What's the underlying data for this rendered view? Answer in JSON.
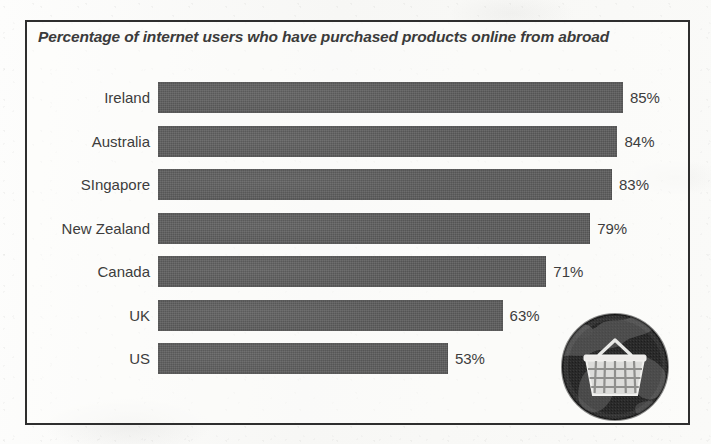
{
  "chart_data": {
    "type": "bar",
    "orientation": "horizontal",
    "title": "Percentage of internet users who have purchased products online from abroad",
    "xlabel": "",
    "ylabel": "",
    "xlim": [
      0,
      100
    ],
    "grid": false,
    "legend": "none",
    "unit": "%",
    "categories": [
      "Ireland",
      "Australia",
      "SIngapore",
      "New Zealand",
      "Canada",
      "UK",
      "US"
    ],
    "values": [
      85,
      84,
      83,
      79,
      71,
      63,
      53
    ],
    "value_labels": [
      "85%",
      "84%",
      "83%",
      "79%",
      "71%",
      "63%",
      "53%"
    ],
    "bar_color": "#5c5c5c",
    "text_color": "#3d3d3d",
    "background_color": "#fbfbfa",
    "border_color": "#2e2e2e"
  },
  "figure": {
    "title": "Percentage of internet users who have purchased products online from abroad",
    "rows": [
      {
        "label": "Ireland",
        "value": 85,
        "value_label": "85%"
      },
      {
        "label": "Australia",
        "value": 84,
        "value_label": "84%"
      },
      {
        "label": "SIngapore",
        "value": 83,
        "value_label": "83%"
      },
      {
        "label": "New Zealand",
        "value": 79,
        "value_label": "79%"
      },
      {
        "label": "Canada",
        "value": 71,
        "value_label": "71%"
      },
      {
        "label": "UK",
        "value": 63,
        "value_label": "63%"
      },
      {
        "label": "US",
        "value": 53,
        "value_label": "53%"
      }
    ],
    "decoration": {
      "icon_name": "globe-shopping-basket-icon"
    }
  }
}
